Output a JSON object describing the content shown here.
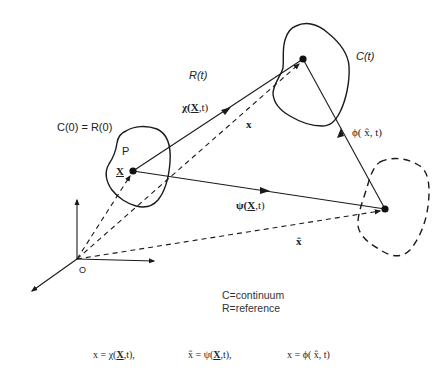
{
  "diagram": {
    "labels": {
      "c0_r0": "C(0) = R(0)",
      "p": "P",
      "X": "X",
      "rt": "R(t)",
      "chi": "χ(",
      "chi_X": "X",
      "chi_t": ",t)",
      "x": "x",
      "ct": "C(t)",
      "phi": "ϕ( x̂, t)",
      "psi": "ψ(",
      "psi_X": "X",
      "psi_t": ",t)",
      "xhat": "x̂",
      "origin": "O"
    },
    "legend": {
      "line1": "C=continuum",
      "line2": "R=reference"
    },
    "equations": [
      {
        "lhs": "x = χ(",
        "X": "X",
        "rhs": ",t),"
      },
      {
        "lhs": "x̂ = ψ(",
        "X": "X",
        "rhs": ",t),"
      },
      {
        "lhs": "x = ϕ( x̂, t)",
        "X": "",
        "rhs": ""
      }
    ],
    "colors": {
      "stroke": "#1a1a1a",
      "background": "#ffffff"
    }
  }
}
